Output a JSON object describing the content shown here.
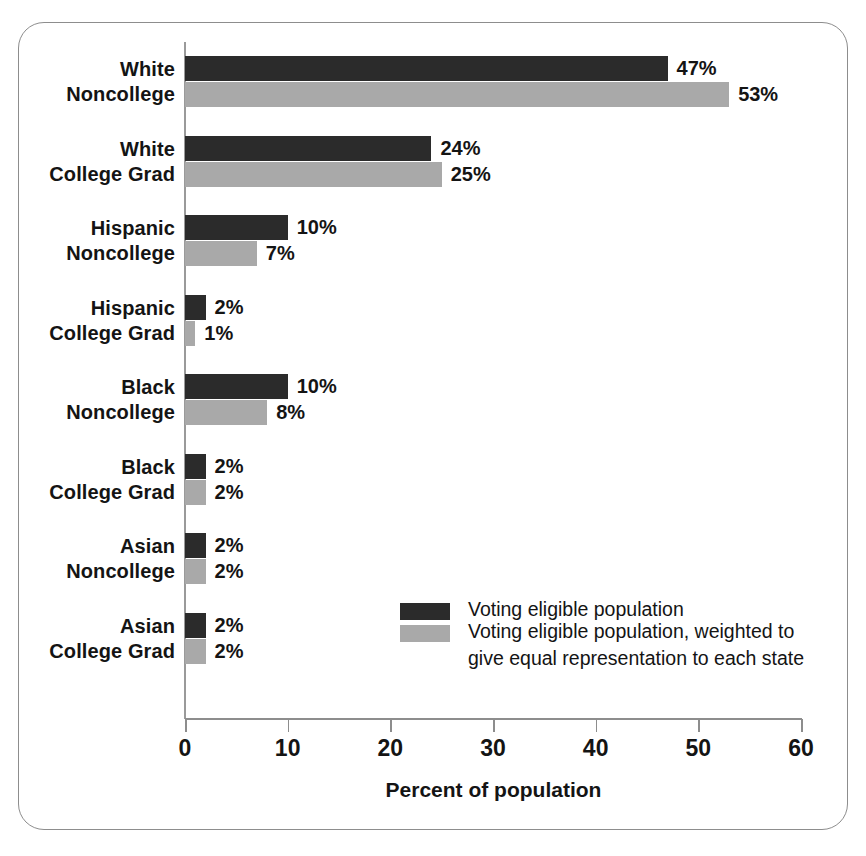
{
  "chart_data": {
    "type": "bar",
    "orientation": "horizontal",
    "title": "",
    "xlabel": "Percent of population",
    "ylabel": "",
    "xlim": [
      0,
      60
    ],
    "xticks": [
      0,
      10,
      20,
      30,
      40,
      50,
      60
    ],
    "xtick_labels": [
      "0",
      "10",
      "20",
      "30",
      "40",
      "50",
      "60"
    ],
    "grid": false,
    "legend_position": "center-right-inside",
    "categories": [
      "White Noncollege",
      "White College Grad",
      "Hispanic Noncollege",
      "Hispanic College Grad",
      "Black Noncollege",
      "Black College Grad",
      "Asian Noncollege",
      "Asian College Grad"
    ],
    "category_lines": [
      [
        "White",
        "Noncollege"
      ],
      [
        "White",
        "College Grad"
      ],
      [
        "Hispanic",
        "Noncollege"
      ],
      [
        "Hispanic",
        "College Grad"
      ],
      [
        "Black",
        "Noncollege"
      ],
      [
        "Black",
        "College Grad"
      ],
      [
        "Asian",
        "Noncollege"
      ],
      [
        "Asian",
        "College Grad"
      ]
    ],
    "series": [
      {
        "name": "Voting eligible population",
        "color": "#2b2b2b",
        "values": [
          47,
          24,
          10,
          2,
          10,
          2,
          2,
          2
        ],
        "labels": [
          "47%",
          "24%",
          "10%",
          "2%",
          "10%",
          "2%",
          "2%",
          "2%"
        ]
      },
      {
        "name": "Voting eligible population, weighted to give equal representation to each state",
        "color": "#a9a9a9",
        "values": [
          53,
          25,
          7,
          1,
          8,
          2,
          2,
          2
        ],
        "labels": [
          "53%",
          "25%",
          "7%",
          "1%",
          "8%",
          "2%",
          "2%",
          "2%"
        ]
      }
    ]
  },
  "legend": {
    "items": [
      {
        "swatch": "dark",
        "lines": [
          "Voting eligible population"
        ]
      },
      {
        "swatch": "light",
        "lines": [
          "Voting eligible population, weighted to",
          "give equal representation to each state"
        ]
      }
    ]
  },
  "colors": {
    "series_dark": "#2b2b2b",
    "series_light": "#a9a9a9",
    "axis": "#8d8d8d",
    "frame": "#8d8d8d",
    "text": "#141414",
    "background": "#ffffff"
  }
}
